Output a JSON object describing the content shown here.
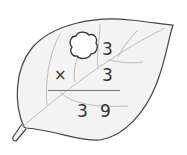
{
  "problem": {
    "row1": {
      "hidden_digit": "blob",
      "ones": "3"
    },
    "row2": {
      "operator": "×",
      "ones": "3"
    },
    "result": {
      "tens": "3",
      "ones": "9"
    }
  },
  "colors": {
    "leaf_fill": "#f3f3f3",
    "leaf_outline": "#444444",
    "vein": "#b5b5b5",
    "text": "#333333",
    "rule": "#777777"
  }
}
